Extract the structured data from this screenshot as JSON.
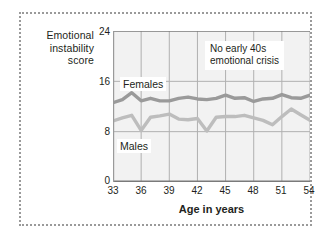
{
  "figure": {
    "border_style": "dotted",
    "border_color": "#9a9a9a",
    "background": "#ffffff"
  },
  "chart_data": {
    "type": "line",
    "title": "",
    "subtitle": "",
    "xlabel": "Age in years",
    "ylabel": "Emotional instability score",
    "xlim": [
      33,
      54
    ],
    "ylim": [
      0,
      24
    ],
    "xticks": [
      "33",
      "36",
      "39",
      "42",
      "45",
      "48",
      "51",
      "54"
    ],
    "yticks": [
      "0",
      "8",
      "16",
      "24"
    ],
    "grid": "both",
    "grid_color": "#b0b0b0",
    "plot_background": "#f2f2f2",
    "legend": "inline-labels",
    "x": [
      33,
      34,
      35,
      36,
      37,
      38,
      39,
      40,
      41,
      42,
      43,
      44,
      45,
      46,
      47,
      48,
      49,
      50,
      51,
      52,
      53,
      54
    ],
    "series": [
      {
        "name": "Females",
        "color": "#9a9a9a",
        "values": [
          12.6,
          13.1,
          14.2,
          12.9,
          13.3,
          12.9,
          12.9,
          13.3,
          13.5,
          13.2,
          13.1,
          13.3,
          13.8,
          13.3,
          13.4,
          12.8,
          13.2,
          13.3,
          13.9,
          13.4,
          13.3,
          13.8
        ]
      },
      {
        "name": "Males",
        "color": "#bdbdbd",
        "values": [
          9.7,
          10.2,
          10.6,
          8.2,
          10.3,
          10.5,
          10.8,
          10.0,
          9.9,
          10.1,
          8.1,
          10.3,
          10.4,
          10.4,
          10.6,
          10.2,
          9.8,
          9.1,
          10.4,
          11.6,
          10.7,
          9.8
        ]
      }
    ],
    "annotations": [
      {
        "text_line1": "No early 40s",
        "text_line2": "emotional crisis",
        "x": 46.5,
        "y": 20
      }
    ],
    "series_labels": [
      {
        "name": "Females"
      },
      {
        "name": "Males"
      }
    ]
  }
}
